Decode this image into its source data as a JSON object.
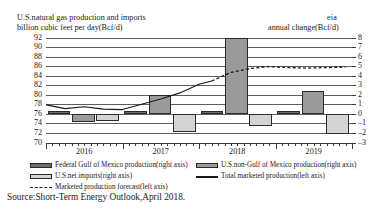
{
  "header": {
    "title": "U.S.natural gas production and imports",
    "subtitle": "billion cubic feet per day(Bcf/d)",
    "logo": "eia",
    "right_axis_title": "annual change(Bcf/d)"
  },
  "source": "Source:Short-Term Energy Outlook,April 2018.",
  "legend": {
    "items": [
      {
        "label": "Federal Gulf of Mexico production(right axis)",
        "marker": "swatch-dark-gray"
      },
      {
        "label": "U.S.non-Gulf of Mexico production(right axis)",
        "marker": "swatch-medium-gray"
      },
      {
        "label": "U.S.net imports(right axis)",
        "marker": "swatch-light-gray"
      },
      {
        "label": "Total marketed production(left axis)",
        "marker": "solid-line"
      },
      {
        "label": "Marketed production forecast(left axis)",
        "marker": "dashed-line"
      }
    ]
  },
  "chart_data": {
    "type": "bar",
    "title": "U.S.natural gas production and imports",
    "subtitle": "billion cubic feet per day(Bcf/d)",
    "xlabel": "",
    "ylabel": "billion cubic feet per day(Bcf/d)",
    "y2label": "annual change(Bcf/d)",
    "ylim": [
      70,
      92
    ],
    "y2lim": [
      -3,
      8
    ],
    "grid": true,
    "legend_position": "bottom",
    "left_ticks": [
      92,
      90,
      88,
      86,
      84,
      82,
      80,
      78,
      76,
      74,
      72,
      70
    ],
    "right_ticks": [
      8,
      7,
      6,
      5,
      4,
      3,
      2,
      1,
      0,
      -1,
      -2,
      -3
    ],
    "categories": [
      "2016",
      "2017",
      "2018",
      "2019"
    ],
    "series": [
      {
        "name": "Federal Gulf of Mexico production(right axis)",
        "axis": "right",
        "values": [
          0.3,
          0.3,
          0.3,
          0.3
        ]
      },
      {
        "name": "U.S.non-Gulf of Mexico production(right axis)",
        "axis": "right",
        "values": [
          -0.9,
          2.0,
          7.9,
          2.4
        ]
      },
      {
        "name": "U.S.net imports(right axis)",
        "axis": "right",
        "values": [
          -0.8,
          -1.9,
          -1.3,
          -2.1
        ]
      }
    ],
    "lines": [
      {
        "name": "Total marketed production(left axis)",
        "axis": "left",
        "style": "solid",
        "x": [
          "2015-01",
          "2015-04",
          "2015-07",
          "2015-10",
          "2016-01",
          "2016-04",
          "2016-07",
          "2016-10",
          "2017-01",
          "2017-04",
          "2017-07",
          "2017-10",
          "2018-01",
          "2018-03"
        ],
        "values": [
          79.8,
          79.4,
          78.6,
          78.5,
          78.0,
          77.2,
          77.6,
          77.1,
          77.0,
          78.1,
          79.2,
          80.5,
          82.3,
          83.0
        ]
      },
      {
        "name": "Marketed production forecast(left axis)",
        "axis": "left",
        "style": "dashed",
        "x": [
          "2018-03",
          "2018-06",
          "2018-09",
          "2018-12",
          "2019-03",
          "2019-06",
          "2019-09",
          "2019-12"
        ],
        "values": [
          83.0,
          84.8,
          85.6,
          86.0,
          85.8,
          85.7,
          85.8,
          85.9
        ]
      }
    ]
  }
}
